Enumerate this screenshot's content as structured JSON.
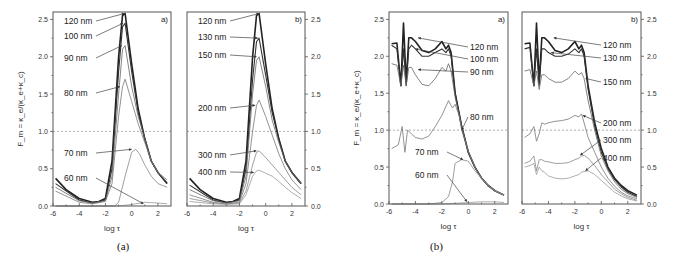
{
  "figures": [
    {
      "caption": "(a)"
    },
    {
      "caption": "(b)"
    }
  ],
  "chart_data": [
    {
      "type": "line",
      "figure": "(a)",
      "panel": "a)",
      "title": "",
      "xlabel": "log τ",
      "ylabel": "F_m = κ_e/(κ_e+κ_c)",
      "xlim": [
        -6,
        3
      ],
      "ylim": [
        0,
        2.6
      ],
      "xticks": [
        "-6",
        "-4",
        "-2",
        "0",
        "2"
      ],
      "yticks": [
        "0.0",
        "0.5",
        "1.0",
        "1.5",
        "2.0",
        "2.5"
      ],
      "y_axis_side": "left",
      "reference_line": 1.0,
      "series": [
        {
          "name": "120 nm",
          "x": [
            -5.8,
            -5,
            -4,
            -3,
            -2.5,
            -2,
            -1.5,
            -1,
            -0.7,
            -0.5,
            0,
            0.5,
            1,
            1.5,
            2,
            2.7
          ],
          "y": [
            0.37,
            0.22,
            0.1,
            0.05,
            0.06,
            0.1,
            0.6,
            2.0,
            2.55,
            2.58,
            1.9,
            1.3,
            0.9,
            0.6,
            0.45,
            0.3
          ]
        },
        {
          "name": "100 nm",
          "x": [
            -5.8,
            -4,
            -3,
            -2,
            -1.5,
            -1,
            -0.7,
            -0.5,
            0,
            0.5,
            1,
            1.5,
            2,
            2.7
          ],
          "y": [
            0.3,
            0.08,
            0.04,
            0.08,
            0.5,
            1.8,
            2.4,
            2.45,
            1.8,
            1.25,
            0.9,
            0.6,
            0.45,
            0.3
          ]
        },
        {
          "name": "90 nm",
          "x": [
            -5.8,
            -4,
            -3,
            -2,
            -1.5,
            -1,
            -0.7,
            -0.5,
            0,
            0.5,
            1,
            1.5,
            2,
            2.7
          ],
          "y": [
            0.25,
            0.07,
            0.04,
            0.07,
            0.4,
            1.5,
            2.1,
            2.15,
            1.6,
            1.2,
            0.9,
            0.6,
            0.45,
            0.32
          ]
        },
        {
          "name": "80 nm",
          "x": [
            -5.8,
            -4,
            -3,
            -2,
            -1.5,
            -1,
            -0.7,
            -0.5,
            0,
            0.5,
            1,
            1.5,
            2,
            2.7
          ],
          "y": [
            0.2,
            0.05,
            0.03,
            0.06,
            0.3,
            1.2,
            1.6,
            1.7,
            1.4,
            1.1,
            0.85,
            0.6,
            0.45,
            0.35
          ]
        },
        {
          "name": "70 nm",
          "x": [
            -5.8,
            -3,
            -2,
            -1.3,
            -1,
            -0.5,
            0,
            0.3,
            0.6,
            1,
            1.5,
            2,
            2.7
          ],
          "y": [
            0.0,
            0.0,
            0.0,
            0.0,
            0.05,
            0.4,
            0.72,
            0.76,
            0.7,
            0.55,
            0.4,
            0.3,
            0.25
          ]
        },
        {
          "name": "60 nm",
          "x": [
            -5.8,
            -3,
            -2,
            -1,
            0,
            1,
            2,
            2.7
          ],
          "y": [
            0.0,
            0.0,
            0.0,
            0.0,
            0.02,
            0.05,
            0.04,
            0.03
          ]
        }
      ],
      "annotations": [
        "120 nm",
        "100 nm",
        "90 nm",
        "80 nm",
        "70 nm",
        "60 nm"
      ]
    },
    {
      "type": "line",
      "figure": "(a)",
      "panel": "b)",
      "xlabel": "log τ",
      "ylabel": "",
      "xlim": [
        -6,
        3
      ],
      "ylim": [
        0,
        2.6
      ],
      "xticks": [
        "-6",
        "-4",
        "-2",
        "0",
        "2"
      ],
      "yticks": [
        "0.0",
        "0.5",
        "1.0",
        "1.5",
        "2.0",
        "2.5"
      ],
      "y_axis_side": "right",
      "reference_line": 1.0,
      "series": [
        {
          "name": "120 nm",
          "x": [
            -5.8,
            -5,
            -4,
            -3,
            -2.5,
            -2,
            -1.5,
            -1,
            -0.7,
            -0.5,
            0,
            0.5,
            1,
            1.5,
            2,
            2.7
          ],
          "y": [
            0.37,
            0.22,
            0.1,
            0.05,
            0.06,
            0.1,
            0.6,
            2.0,
            2.55,
            2.58,
            1.9,
            1.3,
            0.9,
            0.6,
            0.45,
            0.3
          ]
        },
        {
          "name": "130 nm",
          "x": [
            -5.8,
            -4,
            -3,
            -2,
            -1.5,
            -1,
            -0.7,
            -0.5,
            0,
            0.5,
            1,
            1.5,
            2,
            2.7
          ],
          "y": [
            0.28,
            0.08,
            0.04,
            0.08,
            0.5,
            1.7,
            2.2,
            2.25,
            1.75,
            1.25,
            0.9,
            0.6,
            0.45,
            0.3
          ]
        },
        {
          "name": "150 nm",
          "x": [
            -5.8,
            -4,
            -3,
            -2,
            -1.5,
            -1,
            -0.7,
            -0.5,
            0,
            0.5,
            1,
            1.5,
            2,
            2.7
          ],
          "y": [
            0.22,
            0.07,
            0.04,
            0.07,
            0.4,
            1.5,
            1.95,
            2.0,
            1.6,
            1.15,
            0.85,
            0.6,
            0.45,
            0.3
          ]
        },
        {
          "name": "200 nm",
          "x": [
            -5.8,
            -4,
            -3,
            -2,
            -1.5,
            -1,
            -0.7,
            -0.5,
            0,
            0.5,
            1,
            1.5,
            2,
            2.7
          ],
          "y": [
            0.15,
            0.05,
            0.03,
            0.05,
            0.3,
            1.0,
            1.35,
            1.42,
            1.2,
            0.95,
            0.7,
            0.5,
            0.35,
            0.22
          ]
        },
        {
          "name": "300 nm",
          "x": [
            -5.8,
            -4,
            -3,
            -2,
            -1.5,
            -1,
            -0.7,
            -0.5,
            0,
            0.5,
            1,
            1.5,
            2,
            2.7
          ],
          "y": [
            0.1,
            0.04,
            0.03,
            0.04,
            0.2,
            0.55,
            0.72,
            0.74,
            0.65,
            0.55,
            0.45,
            0.35,
            0.25,
            0.15
          ]
        },
        {
          "name": "400 nm",
          "x": [
            -5.8,
            -4,
            -3,
            -2,
            -1.5,
            -1,
            -0.7,
            -0.5,
            0,
            0.5,
            1,
            1.5,
            2,
            2.7
          ],
          "y": [
            0.06,
            0.03,
            0.02,
            0.03,
            0.15,
            0.4,
            0.47,
            0.48,
            0.44,
            0.4,
            0.33,
            0.25,
            0.18,
            0.1
          ]
        }
      ],
      "annotations": [
        "120 nm",
        "130 nm",
        "150 nm",
        "200 nm",
        "300 nm",
        "400 nm"
      ]
    },
    {
      "type": "line",
      "figure": "(b)",
      "panel": "a)",
      "xlabel": "log τ",
      "ylabel": "F_m = κ_e/(κ_e+κ_c)",
      "xlim": [
        -6,
        3
      ],
      "ylim": [
        0,
        2.6
      ],
      "xticks": [
        "-6",
        "-4",
        "-2",
        "0",
        "2"
      ],
      "yticks": [
        "0.0",
        "0.5",
        "1.0",
        "1.5",
        "2.0",
        "2.5"
      ],
      "y_axis_side": "left",
      "reference_line": 1.0,
      "series": [
        {
          "name": "120 nm",
          "x": [
            -5.8,
            -5.4,
            -5.1,
            -4.9,
            -4.7,
            -4.5,
            -4.3,
            -4,
            -3.5,
            -3,
            -2.5,
            -2,
            -1.7,
            -1.5,
            -1.3,
            -1,
            -0.5,
            0,
            0.5,
            1,
            1.5,
            2,
            2.7
          ],
          "y": [
            2.17,
            2.18,
            1.6,
            2.45,
            1.65,
            2.25,
            2.25,
            2.2,
            2.08,
            2.05,
            2.1,
            2.2,
            2.1,
            2.15,
            2.05,
            1.5,
            1.05,
            0.7,
            0.5,
            0.35,
            0.25,
            0.18,
            0.12
          ]
        },
        {
          "name": "100 nm",
          "x": [
            -5.8,
            -5.4,
            -5.1,
            -4.9,
            -4.7,
            -4.5,
            -4.3,
            -4,
            -3.5,
            -3,
            -2.5,
            -2,
            -1.7,
            -1.5,
            -1.3,
            -1,
            -0.5,
            0,
            0.5,
            1,
            1.5,
            2,
            2.7
          ],
          "y": [
            2.15,
            2.1,
            1.6,
            2.1,
            1.6,
            2.1,
            2.15,
            2.1,
            2.0,
            2.0,
            2.05,
            2.1,
            2.05,
            2.1,
            2.0,
            1.5,
            1.05,
            0.7,
            0.5,
            0.35,
            0.25,
            0.18,
            0.12
          ]
        },
        {
          "name": "90 nm",
          "x": [
            -5.8,
            -5.4,
            -5.1,
            -4.9,
            -4.7,
            -4.5,
            -4.3,
            -4,
            -3.5,
            -3,
            -2.5,
            -2,
            -1.7,
            -1.5,
            -1.3,
            -1,
            -0.5,
            0,
            0.5,
            1,
            1.5,
            2,
            2.7
          ],
          "y": [
            1.9,
            1.88,
            1.6,
            1.88,
            1.6,
            1.85,
            1.85,
            1.75,
            1.62,
            1.6,
            1.7,
            1.85,
            1.8,
            1.9,
            1.8,
            1.45,
            1.05,
            0.7,
            0.5,
            0.35,
            0.25,
            0.18,
            0.12
          ]
        },
        {
          "name": "80 nm",
          "x": [
            -5.8,
            -5.3,
            -5,
            -4.8,
            -4.6,
            -4.3,
            -4,
            -3.5,
            -3,
            -2.5,
            -2,
            -1.5,
            -1.2,
            -1,
            -0.7,
            -0.5,
            0,
            0.5,
            1,
            1.5,
            2,
            2.7
          ],
          "y": [
            0.75,
            0.8,
            1.05,
            0.7,
            1.0,
            0.95,
            0.9,
            0.88,
            0.92,
            1.05,
            1.2,
            1.4,
            1.3,
            1.35,
            1.2,
            1.0,
            0.72,
            0.5,
            0.35,
            0.25,
            0.18,
            0.12
          ]
        },
        {
          "name": "70 nm",
          "x": [
            -5.8,
            -3,
            -2,
            -1.5,
            -1.2,
            -1,
            -0.5,
            0,
            0.5,
            1,
            1.5,
            2,
            2.7
          ],
          "y": [
            0.0,
            0.0,
            0.02,
            0.1,
            0.3,
            0.55,
            0.6,
            0.58,
            0.45,
            0.35,
            0.25,
            0.18,
            0.12
          ]
        },
        {
          "name": "60 nm",
          "x": [
            -5.8,
            -3,
            -2,
            -1,
            0,
            1,
            2,
            2.7
          ],
          "y": [
            0.0,
            0.0,
            0.0,
            0.01,
            0.02,
            0.03,
            0.03,
            0.02
          ]
        }
      ],
      "annotations": [
        "120 nm",
        "100 nm",
        "90 nm",
        "80 nm",
        "70 nm",
        "60 nm"
      ]
    },
    {
      "type": "line",
      "figure": "(b)",
      "panel": "b)",
      "xlabel": "log τ",
      "ylabel": "",
      "xlim": [
        -6,
        3
      ],
      "ylim": [
        0,
        2.6
      ],
      "xticks": [
        "-6",
        "-4",
        "-2",
        "0",
        "2"
      ],
      "yticks": [
        "0.0",
        "0.5",
        "1.0",
        "1.5",
        "2.0",
        "2.5"
      ],
      "y_axis_side": "right",
      "reference_line": 1.0,
      "series": [
        {
          "name": "120 nm",
          "x": [
            -5.8,
            -5.4,
            -5.1,
            -4.9,
            -4.7,
            -4.5,
            -4.3,
            -4,
            -3.5,
            -3,
            -2.5,
            -2,
            -1.7,
            -1.5,
            -1.3,
            -1,
            -0.5,
            0,
            0.5,
            1,
            1.5,
            2,
            2.7
          ],
          "y": [
            2.17,
            2.18,
            1.6,
            2.45,
            1.65,
            2.25,
            2.25,
            2.2,
            2.08,
            2.05,
            2.1,
            2.2,
            2.1,
            2.15,
            2.05,
            1.6,
            1.1,
            0.75,
            0.5,
            0.35,
            0.25,
            0.18,
            0.12
          ]
        },
        {
          "name": "130 nm",
          "x": [
            -5.8,
            -5.4,
            -5.1,
            -4.9,
            -4.7,
            -4.5,
            -4.3,
            -4,
            -3.5,
            -3,
            -2.5,
            -2,
            -1.7,
            -1.5,
            -1.3,
            -1,
            -0.5,
            0,
            0.5,
            1,
            1.5,
            2,
            2.7
          ],
          "y": [
            2.1,
            2.12,
            1.6,
            2.1,
            1.6,
            2.1,
            2.1,
            2.05,
            2.0,
            2.0,
            2.03,
            2.1,
            2.05,
            2.1,
            2.0,
            1.55,
            1.05,
            0.7,
            0.48,
            0.33,
            0.23,
            0.16,
            0.1
          ]
        },
        {
          "name": "150 nm",
          "x": [
            -5.8,
            -5.4,
            -5.1,
            -4.9,
            -4.7,
            -4.5,
            -4.3,
            -4,
            -3.5,
            -3,
            -2.5,
            -2,
            -1.7,
            -1.5,
            -1.3,
            -1,
            -0.5,
            0,
            0.5,
            1,
            1.5,
            2,
            2.7
          ],
          "y": [
            1.8,
            1.82,
            1.6,
            1.8,
            1.55,
            1.75,
            1.75,
            1.7,
            1.65,
            1.65,
            1.7,
            1.8,
            1.75,
            1.78,
            1.7,
            1.4,
            1.0,
            0.65,
            0.45,
            0.3,
            0.2,
            0.14,
            0.09
          ]
        },
        {
          "name": "200 nm",
          "x": [
            -5.8,
            -5.4,
            -5.1,
            -4.9,
            -4.7,
            -4.5,
            -4.3,
            -4,
            -3.5,
            -3,
            -2.5,
            -2,
            -1.7,
            -1.5,
            -1.3,
            -1,
            -0.5,
            0,
            0.5,
            1,
            1.5,
            2,
            2.7
          ],
          "y": [
            0.9,
            0.95,
            1.05,
            0.85,
            0.95,
            1.1,
            1.08,
            1.1,
            1.12,
            1.13,
            1.15,
            1.2,
            1.18,
            1.22,
            1.1,
            0.9,
            0.7,
            0.5,
            0.35,
            0.24,
            0.16,
            0.11,
            0.07
          ]
        },
        {
          "name": "300 nm",
          "x": [
            -5.8,
            -5.4,
            -5.1,
            -4.9,
            -4.7,
            -4.5,
            -4.3,
            -4,
            -3.5,
            -3,
            -2.5,
            -2,
            -1.7,
            -1.5,
            -1.3,
            -1,
            -0.5,
            0,
            0.5,
            1,
            1.5,
            2,
            2.7
          ],
          "y": [
            0.55,
            0.58,
            0.65,
            0.45,
            0.6,
            0.6,
            0.58,
            0.57,
            0.55,
            0.55,
            0.56,
            0.6,
            0.62,
            0.65,
            0.66,
            0.62,
            0.52,
            0.4,
            0.3,
            0.2,
            0.14,
            0.09,
            0.05
          ]
        },
        {
          "name": "400 nm",
          "x": [
            -5.8,
            -5.4,
            -5.1,
            -4.9,
            -4.7,
            -4.5,
            -4.3,
            -4,
            -3.5,
            -3,
            -2.5,
            -2,
            -1.7,
            -1.5,
            -1.3,
            -1,
            -0.5,
            0,
            0.5,
            1,
            1.5,
            2,
            2.7
          ],
          "y": [
            0.5,
            0.52,
            0.55,
            0.4,
            0.5,
            0.45,
            0.43,
            0.38,
            0.35,
            0.34,
            0.35,
            0.38,
            0.4,
            0.43,
            0.44,
            0.45,
            0.4,
            0.32,
            0.24,
            0.16,
            0.11,
            0.07,
            0.04
          ]
        }
      ],
      "annotations": [
        "120 nm",
        "130 nm",
        "150 nm",
        "200 nm",
        "300 nm",
        "400 nm"
      ]
    }
  ]
}
